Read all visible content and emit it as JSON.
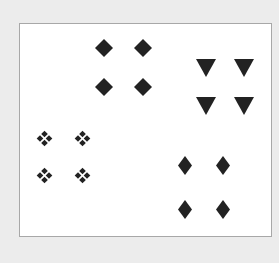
{
  "colors": {
    "background": "#ececec",
    "panel": "#ffffff",
    "panel_border": "#a8a8a8",
    "shape_fill": "#222222"
  },
  "groups": [
    {
      "name": "square-diamond-group",
      "shape": "rotated-square",
      "positions": [
        [
          104,
          48
        ],
        [
          143,
          48
        ],
        [
          104,
          87
        ],
        [
          143,
          87
        ]
      ],
      "size": [
        18,
        18
      ]
    },
    {
      "name": "triangle-group",
      "shape": "down-triangle",
      "positions": [
        [
          206,
          68
        ],
        [
          244,
          68
        ],
        [
          206,
          106
        ],
        [
          244,
          106
        ]
      ],
      "size": [
        20,
        18
      ]
    },
    {
      "name": "petal-cluster-group",
      "shape": "four-dot-cluster",
      "positions": [
        [
          44,
          138
        ],
        [
          82,
          138
        ],
        [
          44,
          175
        ],
        [
          82,
          175
        ]
      ],
      "size": [
        17,
        17
      ]
    },
    {
      "name": "tall-diamond-group",
      "shape": "tall-diamond",
      "positions": [
        [
          185,
          165
        ],
        [
          223,
          165
        ],
        [
          185,
          209
        ],
        [
          223,
          209
        ]
      ],
      "size": [
        14,
        19
      ]
    }
  ]
}
